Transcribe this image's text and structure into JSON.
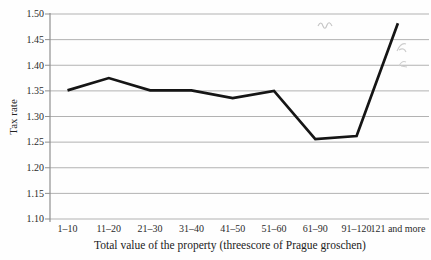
{
  "chart_data": {
    "type": "line",
    "title": "",
    "xlabel": "Total value of the property (threescore of Prague groschen)",
    "ylabel": "Tax rate",
    "categories": [
      "1–10",
      "11–20",
      "21–30",
      "31–40",
      "41–50",
      "51–60",
      "61–90",
      "91–120",
      "121 and more"
    ],
    "values": [
      1.351,
      1.375,
      1.351,
      1.351,
      1.336,
      1.35,
      1.256,
      1.262,
      1.482
    ],
    "series": [
      {
        "name": "Tax rate",
        "values": [
          1.351,
          1.375,
          1.351,
          1.351,
          1.336,
          1.35,
          1.256,
          1.262,
          1.482
        ]
      }
    ],
    "ylim": [
      1.1,
      1.5
    ],
    "ytick_labels": [
      "1.10",
      "1.15",
      "1.20",
      "1.25",
      "1.30",
      "1.35",
      "1.40",
      "1.45",
      "1.50"
    ],
    "grid": true,
    "legend": "none",
    "colors": {
      "line": "#151515",
      "grid": "#b2b2b2",
      "axis": "#8f8f8f",
      "text": "#2b2b2b"
    }
  }
}
